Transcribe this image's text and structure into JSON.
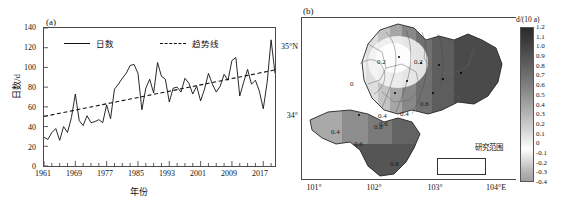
{
  "figure": {
    "panel_a_tag": "(a)",
    "panel_b_tag": "(b)"
  },
  "chart_data": [
    {
      "type": "line",
      "panel": "(a)",
      "title": "",
      "xlabel": "年份",
      "ylabel": "日数/d",
      "xlim": [
        1961,
        2020
      ],
      "ylim": [
        0,
        140
      ],
      "ytick_labels": [
        "140",
        "120",
        "100",
        "80",
        "60",
        "40",
        "20",
        "0"
      ],
      "ytick_values": [
        140,
        120,
        100,
        80,
        60,
        40,
        20,
        0
      ],
      "xtick_labels": [
        "1961",
        "1969",
        "1977",
        "1985",
        "1993",
        "2001",
        "2009",
        "2017"
      ],
      "xtick_values": [
        1961,
        1969,
        1977,
        1985,
        1993,
        2001,
        2009,
        2017
      ],
      "grid": false,
      "legend_position": "top-inside",
      "legend": [
        {
          "label": "日数",
          "style": "solid"
        },
        {
          "label": "趋势线",
          "style": "dashed"
        }
      ],
      "x": [
        1961,
        1962,
        1963,
        1964,
        1965,
        1966,
        1967,
        1968,
        1969,
        1970,
        1971,
        1972,
        1973,
        1974,
        1975,
        1976,
        1977,
        1978,
        1979,
        1980,
        1981,
        1982,
        1983,
        1984,
        1985,
        1986,
        1987,
        1988,
        1989,
        1990,
        1991,
        1992,
        1993,
        1994,
        1995,
        1996,
        1997,
        1998,
        1999,
        2000,
        2001,
        2002,
        2003,
        2004,
        2005,
        2006,
        2007,
        2008,
        2009,
        2010,
        2011,
        2012,
        2013,
        2014,
        2015,
        2016,
        2017,
        2018,
        2019,
        2020
      ],
      "series": [
        {
          "name": "日数",
          "style": "solid",
          "values": [
            29,
            27,
            34,
            38,
            26,
            40,
            34,
            49,
            73,
            46,
            41,
            51,
            44,
            45,
            47,
            44,
            62,
            48,
            78,
            83,
            89,
            94,
            102,
            103,
            94,
            57,
            79,
            88,
            74,
            105,
            91,
            88,
            65,
            79,
            80,
            75,
            89,
            84,
            73,
            81,
            66,
            78,
            94,
            83,
            75,
            81,
            93,
            87,
            107,
            110,
            71,
            85,
            98,
            83,
            87,
            76,
            58,
            85,
            128,
            94
          ]
        },
        {
          "name": "趋势线",
          "style": "dashed",
          "values": [
            50.3,
            51.1,
            51.9,
            52.7,
            53.5,
            54.3,
            55.1,
            55.9,
            56.7,
            57.5,
            58.3,
            59.1,
            59.9,
            60.7,
            61.5,
            62.3,
            63.1,
            63.9,
            64.7,
            65.5,
            66.3,
            67.1,
            67.9,
            68.7,
            69.5,
            70.3,
            71.1,
            71.9,
            72.7,
            73.5,
            74.3,
            75.1,
            75.9,
            76.7,
            77.5,
            78.3,
            79.1,
            79.9,
            80.7,
            81.5,
            82.3,
            83.1,
            83.9,
            84.7,
            85.5,
            86.3,
            87.1,
            87.9,
            88.7,
            89.5,
            90.3,
            91.1,
            91.9,
            92.7,
            93.5,
            94.3,
            95.1,
            95.9,
            96.7,
            97.5
          ]
        }
      ]
    },
    {
      "type": "heatmap",
      "panel": "(b)",
      "title": "",
      "xlabel": "",
      "ylabel": "",
      "xtick_labels": [
        "101°",
        "102°",
        "103°",
        "104°E"
      ],
      "xtick_values": [
        101,
        102,
        103,
        104
      ],
      "ytick_labels": [
        "35°N",
        "34°"
      ],
      "ytick_values": [
        35,
        34
      ],
      "colorbar_title": "d/(10 a)",
      "colorbar_ticks": [
        "1.2",
        "1.1",
        "1.0",
        "0.9",
        "0.8",
        "0.7",
        "0.6",
        "0.5",
        "0.4",
        "0.3",
        "0.2",
        "0.1",
        "0",
        "-0.1",
        "-0.2",
        "-0.3",
        "-0.4"
      ],
      "colorbar_values": [
        1.2,
        1.1,
        1.0,
        0.9,
        0.8,
        0.7,
        0.6,
        0.5,
        0.4,
        0.3,
        0.2,
        0.1,
        0,
        -0.1,
        -0.2,
        -0.3,
        -0.4
      ],
      "legend_box_label": "研究范围",
      "contour_labels": [
        "0",
        "0.2",
        "0.2",
        "0.4",
        "0.4",
        "0.4",
        "0.6",
        "0.6",
        "0.6",
        "0.8",
        "0.8"
      ],
      "annotations": []
    }
  ]
}
